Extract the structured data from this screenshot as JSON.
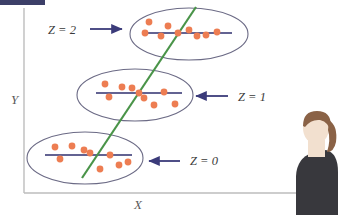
{
  "figure": {
    "type": "scatter",
    "title_bar": {
      "name": "top-left-highlight-bar",
      "color": "#3c3f68"
    },
    "background": "#ffffff",
    "axes": {
      "x_label": "X",
      "y_label": "Y",
      "axis_color": "#bdbdbd",
      "x_axis": {
        "x1": 24,
        "y1": 193,
        "x2": 300,
        "y2": 193
      },
      "y_axis": {
        "x1": 24,
        "y1": 8,
        "x2": 24,
        "y2": 193
      },
      "x_label_pos": {
        "x": 137,
        "y": 207
      },
      "y_label_pos": {
        "x": 11,
        "y": 100
      }
    },
    "colors": {
      "point": "#ED7D52",
      "ellipse": "#6b6a85",
      "group_line": "#2f2f6e",
      "arrow": "#3b3b7a",
      "global_line": "#4a9449",
      "label_text": "#3a3a3a"
    },
    "global_regression_line": {
      "name": "global-regression-line",
      "x1": 82,
      "y1": 178,
      "x2": 196,
      "y2": 7,
      "color": "#4a9449",
      "width": 2.2
    },
    "groups": [
      {
        "id": "z2",
        "label": "Z = 2",
        "label_pos": {
          "x": 48,
          "y": 34
        },
        "arrow": {
          "direction": "right",
          "x1": 90,
          "y1": 29,
          "x2": 124,
          "y2": 29
        },
        "ellipse": {
          "cx": 189,
          "cy": 34,
          "rx": 59,
          "ry": 26,
          "rotate": 0
        },
        "group_line": {
          "x1": 143,
          "y1": 33,
          "x2": 232,
          "y2": 33
        },
        "points": [
          {
            "x": 149,
            "y": 22
          },
          {
            "x": 168,
            "y": 26
          },
          {
            "x": 145,
            "y": 33
          },
          {
            "x": 161,
            "y": 36
          },
          {
            "x": 178,
            "y": 33
          },
          {
            "x": 189,
            "y": 30
          },
          {
            "x": 197,
            "y": 36
          },
          {
            "x": 203,
            "y": 35
          },
          {
            "x": 215,
            "y": 32
          }
        ]
      },
      {
        "id": "z1",
        "label": "Z = 1",
        "label_pos": {
          "x": 238,
          "y": 101
        },
        "arrow": {
          "direction": "left",
          "x1": 228,
          "y1": 96,
          "x2": 194,
          "y2": 96
        },
        "ellipse": {
          "cx": 135,
          "cy": 95,
          "rx": 58,
          "ry": 26,
          "rotate": 0
        },
        "group_line": {
          "x1": 96,
          "y1": 93,
          "x2": 182,
          "y2": 93
        },
        "points": [
          {
            "x": 105,
            "y": 84
          },
          {
            "x": 122,
            "y": 87
          },
          {
            "x": 109,
            "y": 97
          },
          {
            "x": 132,
            "y": 88
          },
          {
            "x": 139,
            "y": 93
          },
          {
            "x": 144,
            "y": 97
          },
          {
            "x": 154,
            "y": 104
          },
          {
            "x": 164,
            "y": 92
          },
          {
            "x": 174,
            "y": 103
          }
        ]
      },
      {
        "id": "z0",
        "label": "Z = 0",
        "label_pos": {
          "x": 190,
          "y": 165
        },
        "arrow": {
          "direction": "left",
          "x1": 180,
          "y1": 161,
          "x2": 147,
          "y2": 161
        },
        "ellipse": {
          "cx": 85,
          "cy": 158,
          "rx": 58,
          "ry": 26,
          "rotate": 0
        },
        "group_line": {
          "x1": 45,
          "y1": 155,
          "x2": 132,
          "y2": 155
        },
        "points": [
          {
            "x": 55,
            "y": 147
          },
          {
            "x": 72,
            "y": 146
          },
          {
            "x": 60,
            "y": 158
          },
          {
            "x": 84,
            "y": 150
          },
          {
            "x": 89,
            "y": 153
          },
          {
            "x": 100,
            "y": 168
          },
          {
            "x": 110,
            "y": 155
          },
          {
            "x": 118,
            "y": 164
          },
          {
            "x": 127,
            "y": 162
          }
        ]
      }
    ],
    "person": {
      "name": "person-illustration",
      "hair_color": "#8a6246",
      "skin_color": "#f2e0cf",
      "shirt_color": "#38383d"
    }
  }
}
